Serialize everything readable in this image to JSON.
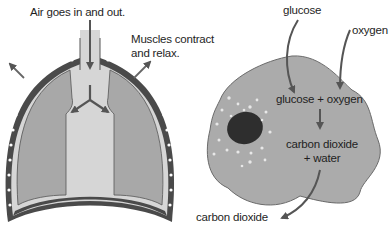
{
  "lungs": {
    "air_label": "Air goes in and out.",
    "muscles_label_line1": "Muscles contract",
    "muscles_label_line2": "and relax."
  },
  "cell": {
    "glucose_label": "glucose",
    "oxygen_label": "oxygen",
    "reactants_label": "glucose + oxygen",
    "products_line1": "carbon dioxide",
    "products_line2": "+ water",
    "output_label": "carbon dioxide"
  },
  "colors": {
    "tissue_gray": "#a8a8a8",
    "airway_light": "#d9d9d9",
    "outline": "#4a4a4a",
    "arrow": "#555555",
    "cell_fill": "#ababab",
    "nucleus": "#2e2e2e"
  }
}
